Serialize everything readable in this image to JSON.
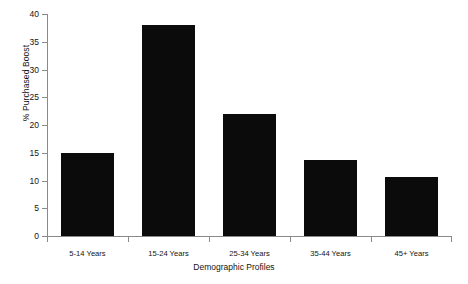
{
  "chart_data": {
    "type": "bar",
    "title": "",
    "xlabel": "Demographic Profiles",
    "ylabel": "% Purchased Boost",
    "categories": [
      "5-14 Years",
      "15-24 Years",
      "25-34 Years",
      "35-44 Years",
      "45+ Years"
    ],
    "values": [
      14.9,
      38.0,
      22.0,
      13.7,
      10.6
    ],
    "ylim": [
      0,
      40
    ],
    "ytick_values": [
      0,
      5,
      10,
      15,
      20,
      25,
      30,
      35,
      40
    ],
    "ytick_labels": [
      "0",
      "5",
      "10",
      "15",
      "20",
      "25",
      "30",
      "35",
      "40"
    ],
    "grid": false,
    "legend": false,
    "bar_color": "#0b0b0b",
    "axis_color": "#8a8a8a",
    "background_color": "#ffffff"
  }
}
